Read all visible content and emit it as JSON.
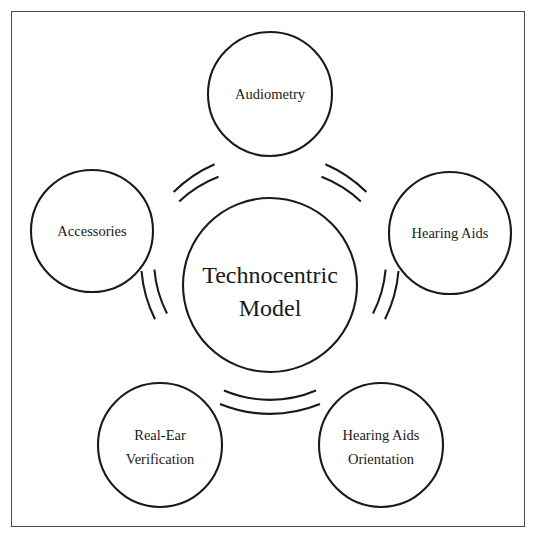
{
  "diagram": {
    "type": "cycle-hub-and-spoke",
    "center": {
      "label_line1": "Technocentric",
      "label_line2": "Model",
      "shape": "circle"
    },
    "nodes": [
      {
        "id": "audiometry",
        "label_line1": "Audiometry",
        "label_line2": "",
        "position": "top"
      },
      {
        "id": "hearing-aids",
        "label_line1": "Hearing Aids",
        "label_line2": "",
        "position": "right"
      },
      {
        "id": "hearing-aids-orientation",
        "label_line1": "Hearing Aids",
        "label_line2": "Orientation",
        "position": "bottom-right"
      },
      {
        "id": "real-ear-verification",
        "label_line1": "Real-Ear",
        "label_line2": "Verification",
        "position": "bottom-left"
      },
      {
        "id": "accessories",
        "label_line1": "Accessories",
        "label_line2": "",
        "position": "left"
      }
    ],
    "colors": {
      "stroke": "#1a1a1a",
      "fill": "#ffffff",
      "frame": "#4a4a4a",
      "background": "#ffffff"
    }
  }
}
